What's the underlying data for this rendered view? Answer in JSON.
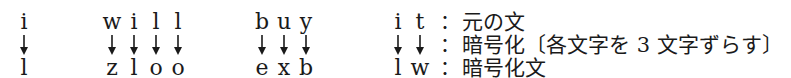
{
  "words": [
    {
      "original": [
        "i"
      ],
      "encrypted": [
        "l"
      ],
      "x": [
        24
      ]
    },
    {
      "original": [
        "w",
        "i",
        "l",
        "l"
      ],
      "encrypted": [
        "z",
        "l",
        "o",
        "o"
      ],
      "x": [
        112,
        134,
        156,
        178
      ]
    },
    {
      "original": [
        "b",
        "u",
        "y"
      ],
      "encrypted": [
        "e",
        "x",
        "b"
      ],
      "x": [
        262,
        284,
        306
      ]
    },
    {
      "original": [
        "i",
        "t"
      ],
      "encrypted": [
        "l",
        "w"
      ],
      "x": [
        398,
        420
      ]
    }
  ],
  "arrow_glyph": "↓",
  "labels": {
    "row1": "元の文",
    "row2": "暗号化〔各文字を 3 文字ずらす〕",
    "row3": "暗号化文"
  },
  "colon": "："
}
